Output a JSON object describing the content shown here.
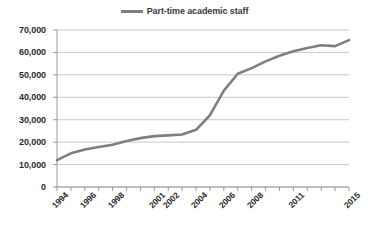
{
  "chart_data": {
    "type": "line",
    "title": "",
    "subtitle": "",
    "xlabel": "",
    "ylabel": "",
    "legend_position": "top-center",
    "grid": "horizontal",
    "ylim": [
      0,
      70000
    ],
    "ytick_step": 10000,
    "ytick_labels": [
      "0",
      "10,000",
      "20,000",
      "30,000",
      "40,000",
      "50,000",
      "60,000",
      "70,000"
    ],
    "ytick_values": [
      0,
      10000,
      20000,
      30000,
      40000,
      50000,
      60000,
      70000
    ],
    "xtick_labels": [
      "1994",
      "1996",
      "1998",
      "2001",
      "2002",
      "2004",
      "2006",
      "2008",
      "2011",
      "2015"
    ],
    "x": [
      "1994",
      "1995",
      "1996",
      "1997",
      "1998",
      "1999",
      "2000",
      "2001",
      "2002",
      "2003",
      "2004",
      "2005",
      "2006",
      "2007",
      "2008",
      "2009",
      "2010",
      "2011",
      "2012",
      "2013",
      "2014",
      "2015"
    ],
    "series": [
      {
        "name": "Part-time academic staff",
        "color": "#7f7f7f",
        "values": [
          12000,
          15000,
          16700,
          17800,
          18800,
          20500,
          21800,
          22700,
          23000,
          23400,
          25500,
          32000,
          43000,
          50500,
          53000,
          56000,
          58500,
          60500,
          62000,
          63200,
          62800,
          65500
        ]
      }
    ]
  },
  "legend": {
    "entries": [
      {
        "label": "Part-time academic staff",
        "color": "#7f7f7f"
      }
    ]
  },
  "axes": {
    "y": {
      "ticks": [
        {
          "label": "70,000",
          "value": 70000
        },
        {
          "label": "60,000",
          "value": 60000
        },
        {
          "label": "50,000",
          "value": 50000
        },
        {
          "label": "40,000",
          "value": 40000
        },
        {
          "label": "30,000",
          "value": 30000
        },
        {
          "label": "20,000",
          "value": 20000
        },
        {
          "label": "10,000",
          "value": 10000
        },
        {
          "label": "0",
          "value": 0
        }
      ]
    },
    "x": {
      "ticks": [
        {
          "label": "1994",
          "index": 0
        },
        {
          "label": "1996",
          "index": 2
        },
        {
          "label": "1998",
          "index": 4
        },
        {
          "label": "2001",
          "index": 7
        },
        {
          "label": "2002",
          "index": 8
        },
        {
          "label": "2004",
          "index": 10
        },
        {
          "label": "2006",
          "index": 12
        },
        {
          "label": "2008",
          "index": 14
        },
        {
          "label": "2011",
          "index": 17
        },
        {
          "label": "2015",
          "index": 21
        }
      ]
    }
  },
  "colors": {
    "line": "#7f7f7f",
    "gridline": "#c9c9c9",
    "axis": "#9a9a9a",
    "text": "#2b2b2b"
  }
}
